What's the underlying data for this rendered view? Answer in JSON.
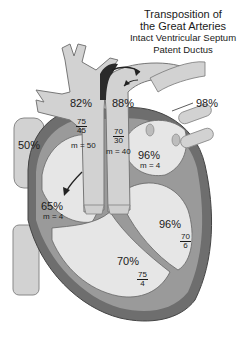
{
  "title": {
    "line1": "Transposition of",
    "line2": "the Great Arteries",
    "line3": "Intact Ventricular Septum",
    "line4": "Patent Ductus"
  },
  "colors": {
    "chamber_fill": "#e6e6e6",
    "vessel_fill": "#d2d2d2",
    "wall_dark": "#6e6e6e",
    "wall_mid": "#9a9a9a",
    "outline": "#555555",
    "arrow": "#222222"
  },
  "labels": {
    "svc": {
      "sat": "50%"
    },
    "aorta": {
      "sat": "82%",
      "pressure_sys": "75",
      "pressure_dia": "45",
      "mean": "m = 50"
    },
    "pulmonary_artery": {
      "sat": "88%",
      "pressure_sys": "70",
      "pressure_dia": "30",
      "mean": "m = 40"
    },
    "pulmonary_veins": {
      "sat": "98%"
    },
    "left_atrium": {
      "sat": "96%",
      "mean": "m = 4"
    },
    "right_atrium": {
      "sat": "65%",
      "mean": "m = 4"
    },
    "left_ventricle": {
      "sat": "96%",
      "pressure_sys": "70",
      "pressure_dia": "6"
    },
    "right_ventricle": {
      "sat": "70%",
      "pressure_sys": "75",
      "pressure_dia": "4"
    }
  }
}
